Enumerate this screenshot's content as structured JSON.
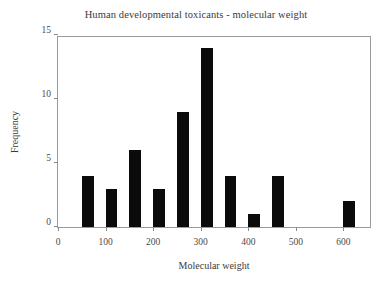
{
  "chart_data": {
    "type": "bar",
    "title": "Human developmental toxicants - molecular weight",
    "xlabel": "Molecular weight",
    "ylabel": "Frequency",
    "xlim": [
      0,
      660
    ],
    "ylim": [
      0,
      15
    ],
    "grid": false,
    "legend": null,
    "bin_width": 50,
    "bar_color": "#0b0b0b",
    "frame_color": "#9a9a9a",
    "xticks": [
      0,
      100,
      200,
      300,
      400,
      500,
      600
    ],
    "xtick_labels": [
      "0",
      "100",
      "200",
      "300",
      "400",
      "500",
      "600"
    ],
    "yticks": [
      0,
      5,
      10,
      15
    ],
    "ytick_labels": [
      "0",
      "5",
      "10",
      "15"
    ],
    "categories": [
      50,
      100,
      150,
      200,
      250,
      300,
      350,
      400,
      450,
      600
    ],
    "values": [
      4,
      3,
      6,
      3,
      9,
      14,
      4,
      1,
      4,
      2
    ],
    "bars": [
      {
        "x": 50,
        "value": 4
      },
      {
        "x": 100,
        "value": 3
      },
      {
        "x": 150,
        "value": 6
      },
      {
        "x": 200,
        "value": 3
      },
      {
        "x": 250,
        "value": 9
      },
      {
        "x": 300,
        "value": 14
      },
      {
        "x": 350,
        "value": 4
      },
      {
        "x": 400,
        "value": 1
      },
      {
        "x": 450,
        "value": 4
      },
      {
        "x": 600,
        "value": 2
      }
    ]
  }
}
